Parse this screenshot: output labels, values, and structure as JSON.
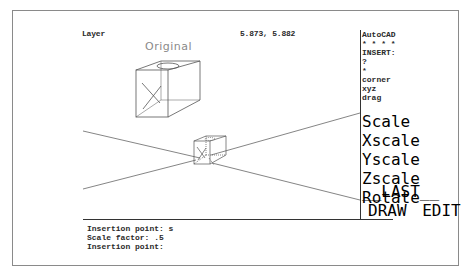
{
  "status": {
    "layer_label": "Layer",
    "coordinates": "5.873, 5.882"
  },
  "drawing": {
    "original_label": "Original",
    "line_color": "#555555",
    "label_color": "#8a8a8a"
  },
  "screen_menu": {
    "items": [
      "AutoCAD",
      "* * * *",
      "INSERT:",
      "?",
      "*",
      "corner",
      "xyz",
      "drag"
    ],
    "options": [
      "Scale",
      "Xscale",
      "Yscale",
      "Zscale",
      "Rotate"
    ],
    "nav": [
      "__LAST__",
      "DRAW",
      "EDIT"
    ]
  },
  "command_line": {
    "lines": [
      "Insertion point: s",
      "Scale factor: .5",
      "Insertion point:"
    ]
  }
}
